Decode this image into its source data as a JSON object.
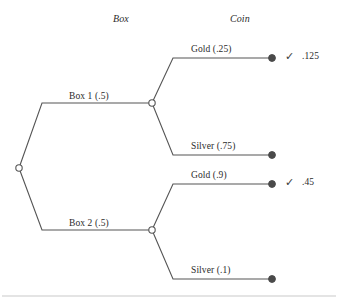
{
  "figure": {
    "headers": [
      {
        "label": "Box",
        "x": 113,
        "y": 14
      },
      {
        "label": "Coin",
        "x": 230,
        "y": 14
      }
    ],
    "colors": {
      "line": "#555555",
      "node_open_fill": "#ffffff",
      "node_filled": "#4a4a4a",
      "text": "#2b2b2b",
      "rule": "#c9c9c9"
    },
    "root": {
      "name": "root-node",
      "x": 19,
      "y": 168
    },
    "stage1": [
      {
        "id": "box1",
        "label": "Box 1 (.5)",
        "probability": ".5",
        "node_x": 152,
        "node_y": 103,
        "label_x": 69,
        "label_y": 92
      },
      {
        "id": "box2",
        "label": "Box 2 (.5)",
        "probability": ".5",
        "node_x": 152,
        "node_y": 230,
        "label_x": 69,
        "label_y": 219
      }
    ],
    "stage2": [
      {
        "id": "box1-gold",
        "label": "Gold (.25)",
        "probability": ".25",
        "end_x": 272,
        "end_y": 58,
        "label_x": 191,
        "label_y": 45,
        "check": "✓",
        "value": ".125",
        "has_check": true
      },
      {
        "id": "box1-silver",
        "label": "Silver (.75)",
        "probability": ".75",
        "end_x": 272,
        "end_y": 155,
        "label_x": 191,
        "label_y": 142,
        "check": "",
        "value": "",
        "has_check": false
      },
      {
        "id": "box2-gold",
        "label": "Gold (.9)",
        "probability": ".9",
        "end_x": 272,
        "end_y": 184,
        "label_x": 191,
        "label_y": 171,
        "check": "✓",
        "value": ".45",
        "has_check": true
      },
      {
        "id": "box2-silver",
        "label": "Silver (.1)",
        "probability": ".1",
        "end_x": 272,
        "end_y": 279,
        "label_x": 191,
        "label_y": 266,
        "check": "",
        "value": "",
        "has_check": false
      }
    ],
    "outcomes": [
      {
        "check_x": 285,
        "check_y": 51,
        "value_x": 302,
        "value_y": 52
      },
      {
        "check_x": 285,
        "check_y": 177,
        "value_x": 302,
        "value_y": 178
      }
    ],
    "rule": {
      "x1": 2,
      "y1": 296,
      "x2": 336,
      "y2": 296
    }
  }
}
